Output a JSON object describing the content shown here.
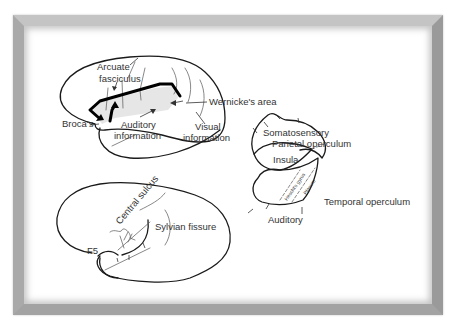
{
  "figure": {
    "top_brain": {
      "labels": {
        "arcuate": "Arcuate",
        "fasciculus": "fasciculus",
        "broca": "Broca's",
        "auditory_1": "Auditory",
        "auditory_2": "information",
        "visual_1": "Visual",
        "visual_2": "information",
        "wernicke": "Wernicke's area"
      }
    },
    "bottom_brain": {
      "labels": {
        "central_sulcus": "Central sulcus",
        "sylvian_fissure": "Sylvian fissure",
        "f5": "F5"
      }
    },
    "opercula": {
      "labels": {
        "somatosensory": "Somatosensory",
        "parietal_operculum": "Parietal operculum",
        "insula": "Insula",
        "heschls_gyrus": "Heschl's gyrus",
        "planum": "Planum",
        "temporal_operculum": "Temporal operculum",
        "auditory": "Auditory"
      }
    },
    "colors": {
      "frame": "#b8b8b8",
      "line": "#1a1a1a",
      "shade": "#e6e6e6",
      "text": "#333333"
    }
  }
}
